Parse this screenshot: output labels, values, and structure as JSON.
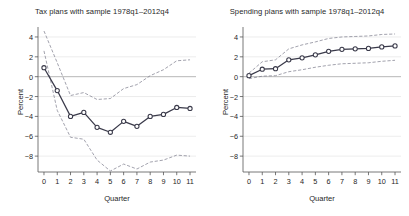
{
  "figure": {
    "width": 409,
    "height": 216,
    "background": "#ffffff",
    "line_color": "#3a3a4a",
    "band_color": "#7a7a8a",
    "grid_color": "#d9d9d9",
    "axis_color": "#555555"
  },
  "panels": [
    {
      "id": "tax",
      "title": "Tax plans with sample 1978q1–2012q4",
      "xlabel": "Quarter",
      "ylabel": "Percent"
    },
    {
      "id": "spending",
      "title": "Spending plans with sample 1978q1–2012q4",
      "xlabel": "Quarter",
      "ylabel": "Percent"
    }
  ],
  "chart_data": [
    {
      "type": "line",
      "id": "tax",
      "title": "Tax plans with sample 1978q1–2012q4",
      "xlabel": "Quarter",
      "ylabel": "Percent",
      "xlim": [
        -0.45,
        11.45
      ],
      "ylim": [
        -9.6,
        4.6
      ],
      "xticks": [
        0,
        1,
        2,
        3,
        4,
        5,
        6,
        7,
        8,
        9,
        10,
        11
      ],
      "xticklabels": [
        "0",
        "1",
        "2",
        "3",
        "4",
        "5",
        "6",
        "7",
        "8",
        "9",
        "10",
        "11"
      ],
      "yticks": [
        4,
        2,
        0,
        -2,
        -4,
        -6,
        -8
      ],
      "yticklabels": [
        "4",
        "2",
        "0",
        "−2",
        "−4",
        "−6",
        "−8"
      ],
      "grid": true,
      "legend": null,
      "x": [
        0,
        1,
        2,
        3,
        4,
        5,
        6,
        7,
        8,
        9,
        10,
        11
      ],
      "series": [
        {
          "name": "point estimate",
          "style": "solid-with-circle-markers",
          "values": [
            0.9,
            -1.4,
            -4.0,
            -3.6,
            -5.1,
            -5.6,
            -4.5,
            -5.0,
            -4.0,
            -3.8,
            -3.1,
            -3.2
          ]
        },
        {
          "name": "upper confidence band",
          "style": "dashed",
          "values": [
            4.6,
            1.4,
            -1.9,
            -1.6,
            -2.3,
            -2.2,
            -1.2,
            -0.8,
            0.1,
            0.7,
            1.6,
            1.7
          ]
        },
        {
          "name": "lower confidence band",
          "style": "dashed",
          "values": [
            2.6,
            -3.4,
            -6.1,
            -6.3,
            -8.4,
            -9.5,
            -8.8,
            -9.3,
            -8.6,
            -8.4,
            -7.9,
            -8.0
          ]
        }
      ]
    },
    {
      "type": "line",
      "id": "spending",
      "title": "Spending plans with sample 1978q1–2012q4",
      "xlabel": "Quarter",
      "ylabel": "Percent",
      "xlim": [
        -0.45,
        11.45
      ],
      "ylim": [
        -9.6,
        4.6
      ],
      "xticks": [
        0,
        1,
        2,
        3,
        4,
        5,
        6,
        7,
        8,
        9,
        10,
        11
      ],
      "xticklabels": [
        "0",
        "1",
        "2",
        "3",
        "4",
        "5",
        "6",
        "7",
        "8",
        "9",
        "10",
        "11"
      ],
      "yticks": [
        4,
        2,
        0,
        -2,
        -4,
        -6,
        -8
      ],
      "yticklabels": [
        "4",
        "2",
        "0",
        "−2",
        "−4",
        "−6",
        "−8"
      ],
      "grid": true,
      "legend": null,
      "x": [
        0,
        1,
        2,
        3,
        4,
        5,
        6,
        7,
        8,
        9,
        10,
        11
      ],
      "series": [
        {
          "name": "point estimate",
          "style": "solid-with-circle-markers",
          "values": [
            0.1,
            0.75,
            0.8,
            1.7,
            1.9,
            2.2,
            2.55,
            2.75,
            2.8,
            2.85,
            3.0,
            3.1
          ]
        },
        {
          "name": "upper confidence band",
          "style": "dashed",
          "values": [
            0.35,
            1.5,
            1.7,
            2.8,
            3.2,
            3.5,
            3.85,
            4.0,
            4.05,
            4.1,
            4.25,
            4.3
          ]
        },
        {
          "name": "lower confidence band",
          "style": "dashed",
          "values": [
            -0.2,
            0.05,
            0.1,
            0.5,
            0.7,
            0.95,
            1.15,
            1.3,
            1.35,
            1.4,
            1.55,
            1.65
          ]
        }
      ]
    }
  ]
}
